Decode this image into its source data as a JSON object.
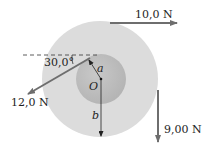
{
  "diagram": {
    "outer_disk": {
      "label": "b",
      "color": "#dcdcdc"
    },
    "inner_disk": {
      "label": "a",
      "color": "#bdbdbd"
    },
    "center_label": "O",
    "angle_label": "30,0°",
    "forces": [
      {
        "label": "10,0 N",
        "direction": "right"
      },
      {
        "label": "12,0 N",
        "direction": "down-left"
      },
      {
        "label": "9,00 N",
        "direction": "down"
      }
    ],
    "arrow_color": "#6e6e6e"
  }
}
